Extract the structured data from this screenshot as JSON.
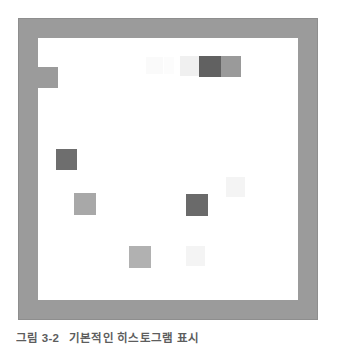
{
  "figure": {
    "kind": "framed-grid-illustration",
    "background_color": "#ffffff",
    "frame": {
      "name": "picture-frame-border",
      "fill_color": "#9b9b9b",
      "edge_color": "#8e8e8e",
      "x": 18,
      "y": 18,
      "width": 300,
      "height": 302,
      "border_thickness": 20
    },
    "canvas": {
      "name": "white-plot-area",
      "fill_color": "#ffffff",
      "x": 38,
      "y": 38,
      "width": 260,
      "height": 262
    },
    "notch": {
      "name": "left-edge-tab",
      "fill_color": "#9b9b9b",
      "x": 38,
      "y": 67,
      "width": 20,
      "height": 21
    },
    "cells": [
      {
        "id": "cell-1",
        "label": "faint-top-left-of-pair",
        "x": 146,
        "y": 57,
        "w": 17,
        "h": 17,
        "color": "#fafafa"
      },
      {
        "id": "cell-2",
        "label": "faint-top-mid",
        "x": 164,
        "y": 57,
        "w": 10,
        "h": 17,
        "color": "#fcfcfc"
      },
      {
        "id": "cell-3",
        "label": "pale-top-right",
        "x": 180,
        "y": 56,
        "w": 19,
        "h": 20,
        "color": "#f0f0f0"
      },
      {
        "id": "cell-4",
        "label": "dark-top-right",
        "x": 199,
        "y": 56,
        "w": 22,
        "h": 21,
        "color": "#616161"
      },
      {
        "id": "cell-5",
        "label": "mid-top-far-right",
        "x": 221,
        "y": 56,
        "w": 20,
        "h": 21,
        "color": "#9a9a9a"
      },
      {
        "id": "cell-6",
        "label": "dark-left-mid",
        "x": 56,
        "y": 149,
        "w": 21,
        "h": 21,
        "color": "#6e6e6e"
      },
      {
        "id": "cell-7",
        "label": "mid-left-lower",
        "x": 74,
        "y": 193,
        "w": 22,
        "h": 22,
        "color": "#a8a8a8"
      },
      {
        "id": "cell-8",
        "label": "dark-center",
        "x": 186,
        "y": 194,
        "w": 22,
        "h": 22,
        "color": "#6a6a6a"
      },
      {
        "id": "cell-9",
        "label": "faint-right-mid",
        "x": 226,
        "y": 177,
        "w": 19,
        "h": 20,
        "color": "#f4f4f4"
      },
      {
        "id": "cell-10",
        "label": "mid-bottom-center",
        "x": 129,
        "y": 246,
        "w": 22,
        "h": 22,
        "color": "#b1b1b1"
      },
      {
        "id": "cell-11",
        "label": "faint-bottom-center",
        "x": 186,
        "y": 246,
        "w": 19,
        "h": 20,
        "color": "#f4f4f4"
      }
    ]
  },
  "caption": {
    "name": "figure-caption",
    "label": "그림 3-2",
    "text": "기본적인 히스토그램 표시",
    "color": "#5d5d5d",
    "clipped": true
  }
}
